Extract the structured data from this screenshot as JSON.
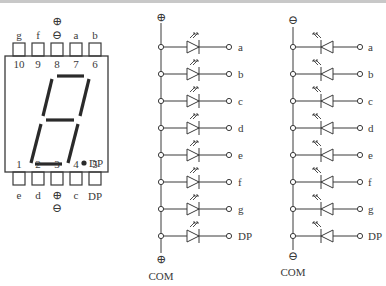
{
  "caption_fragment": "",
  "display": {
    "top_pins": [
      {
        "number": "10",
        "segment": "g"
      },
      {
        "number": "9",
        "segment": "f"
      },
      {
        "number": "8",
        "segment": "⊖",
        "extra": "⊕"
      },
      {
        "number": "7",
        "segment": "a"
      },
      {
        "number": "6",
        "segment": "b"
      }
    ],
    "bottom_pins": [
      {
        "number": "1",
        "segment": "e"
      },
      {
        "number": "2",
        "segment": "d"
      },
      {
        "number": "3",
        "segment": "⊕",
        "extra": "⊖"
      },
      {
        "number": "4",
        "segment": "c"
      },
      {
        "number": "5",
        "segment": "DP"
      }
    ],
    "dp_label": "DP"
  },
  "common_anode": {
    "top_symbol": "⊕",
    "bottom_symbol": "⊕",
    "com_label": "COM",
    "outputs": [
      "a",
      "b",
      "c",
      "d",
      "e",
      "f",
      "g",
      "DP"
    ]
  },
  "common_cathode": {
    "top_symbol": "⊖",
    "bottom_symbol": "⊖",
    "com_label": "COM",
    "outputs": [
      "a",
      "b",
      "c",
      "d",
      "e",
      "f",
      "g",
      "DP"
    ]
  },
  "colors": {
    "ink": "#3a3a3a",
    "background": "#ffffff"
  }
}
